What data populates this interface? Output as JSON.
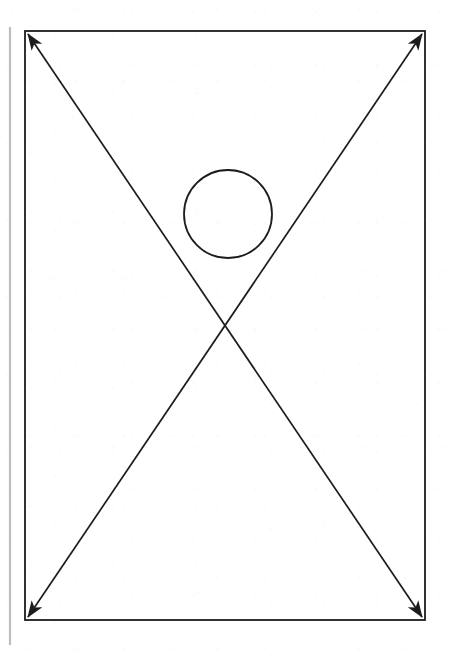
{
  "document": {
    "title": "Crossed-Diagonals Rectangle with Circle",
    "type": "technical-line-drawing",
    "width": 449,
    "height": 650,
    "background_color": "#ffffff"
  },
  "chart_data": {
    "type": "diagram",
    "title": "",
    "subtitle": "",
    "annotations": [],
    "background": "#ffffff",
    "shapes": [
      {
        "name": "margin-rule",
        "kind": "line",
        "x1": 10,
        "y1": 27,
        "x2": 10,
        "y2": 645,
        "stroke": "#bdbdbd",
        "stroke_width": 2.2,
        "arrow_start": false,
        "arrow_end": false
      },
      {
        "name": "outer-rectangle",
        "kind": "rect",
        "x": 25,
        "y": 31,
        "width": 400,
        "height": 589,
        "stroke": "#1c1c1c",
        "stroke_width": 1.8,
        "fill": "none"
      },
      {
        "name": "diagonal-top-left-to-bottom-right",
        "kind": "line",
        "x1": 28,
        "y1": 34,
        "x2": 422,
        "y2": 617,
        "stroke": "#1c1c1c",
        "stroke_width": 1.7,
        "arrow_start": true,
        "arrow_end": true
      },
      {
        "name": "diagonal-top-right-to-bottom-left",
        "kind": "line",
        "x1": 422,
        "y1": 34,
        "x2": 28,
        "y2": 617,
        "stroke": "#1c1c1c",
        "stroke_width": 1.7,
        "arrow_start": true,
        "arrow_end": true
      },
      {
        "name": "circle",
        "kind": "circle",
        "cx": 228,
        "cy": 214,
        "r": 44,
        "stroke": "#1c1c1c",
        "stroke_width": 1.8,
        "fill": "none"
      }
    ],
    "points_of_interest": [
      {
        "name": "diagonal-intersection",
        "x": 225,
        "y": 325
      },
      {
        "name": "circle-center",
        "x": 228,
        "y": 214
      },
      {
        "name": "rect-center",
        "x": 225,
        "y": 325
      }
    ],
    "arrowheads": [
      {
        "name": "arrowhead-top-left",
        "x": 28,
        "y": 34,
        "direction": "up-left"
      },
      {
        "name": "arrowhead-top-right",
        "x": 422,
        "y": 34,
        "direction": "up-right"
      },
      {
        "name": "arrowhead-bottom-left",
        "x": 28,
        "y": 617,
        "direction": "down-left"
      },
      {
        "name": "arrowhead-bottom-right",
        "x": 422,
        "y": 617,
        "direction": "down-right"
      }
    ],
    "legend": [],
    "grid": false
  }
}
